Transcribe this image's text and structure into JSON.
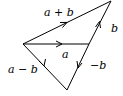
{
  "diagram": {
    "title": "",
    "stroke_color": "#000000",
    "background": "#ffffff",
    "points": {
      "origin": [
        23,
        44
      ],
      "a_tip": [
        89,
        44
      ],
      "sum_tip": [
        111,
        1
      ],
      "diff_tip": [
        67,
        90
      ]
    },
    "vectors": [
      {
        "id": "a",
        "label": "a",
        "from": "origin",
        "to": "a_tip"
      },
      {
        "id": "b",
        "label": "b",
        "from": "a_tip",
        "to": "sum_tip"
      },
      {
        "id": "a_plus_b",
        "label": "a + b",
        "from": "origin",
        "to": "sum_tip"
      },
      {
        "id": "neg_b",
        "label": "−b",
        "from": "a_tip",
        "to": "diff_tip"
      },
      {
        "id": "a_minus_b",
        "label": "a − b",
        "from": "origin",
        "to": "diff_tip"
      }
    ],
    "labels": {
      "a": "a",
      "b": "b",
      "a_plus_b": "a + b",
      "neg_b": "−b",
      "a_minus_b": "a − b"
    }
  }
}
